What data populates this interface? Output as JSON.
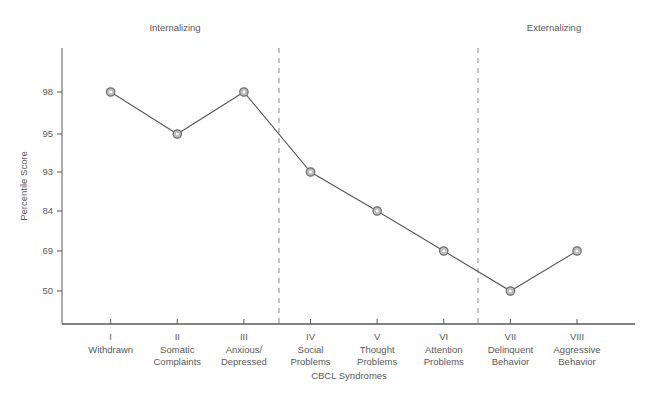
{
  "figure": {
    "caption": ""
  },
  "chart_data": {
    "type": "line",
    "title": "",
    "xlabel": "CBCL Syndromes",
    "ylabel": "Percentile Score",
    "grid": false,
    "legend": "none",
    "categories": [
      "Withdrawn",
      "Somatic Complaints",
      "Anxious/ Depressed",
      "Social Problems",
      "Thought Problems",
      "Attention Problems",
      "Delinquent Behavior",
      "Aggressive Behavior"
    ],
    "category_numerals": [
      "I",
      "II",
      "III",
      "IV",
      "V",
      "VI",
      "VII",
      "VIII"
    ],
    "category_lines": [
      [
        "Withdrawn"
      ],
      [
        "Somatic",
        "Complaints"
      ],
      [
        "Anxious/",
        "Depressed"
      ],
      [
        "Social",
        "Problems"
      ],
      [
        "Thought",
        "Problems"
      ],
      [
        "Attention",
        "Problems"
      ],
      [
        "Delinquent",
        "Behavior"
      ],
      [
        "Aggressive",
        "Behavior"
      ]
    ],
    "values": [
      98,
      95,
      98,
      93,
      84,
      69,
      50,
      69
    ],
    "ytick_labels": [
      "98",
      "95",
      "93",
      "84",
      "69",
      "50"
    ],
    "ytick_values": [
      98,
      95,
      93,
      84,
      69,
      50
    ],
    "ytick_pixel_y": [
      92,
      134,
      172,
      211,
      251,
      291
    ],
    "annotations": [
      {
        "label": "Internalizing",
        "x": 175
      },
      {
        "label": "Externalizing",
        "x": 554
      }
    ],
    "separators": [
      279,
      478
    ],
    "colors": {
      "line": "#58585a",
      "marker_fill": "#bfbfbf",
      "marker_stroke": "#6b6b6d",
      "axis": "#58585a",
      "separator": "#8a8a8c",
      "text": "#58585a"
    }
  }
}
